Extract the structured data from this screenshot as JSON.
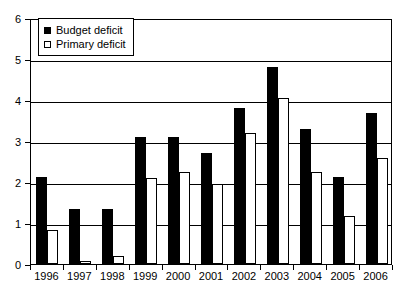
{
  "chart_data": {
    "type": "bar",
    "title": "",
    "subtitle": "",
    "xlabel": "",
    "ylabel": "",
    "ylim": [
      0,
      6
    ],
    "yticks": [
      0,
      1,
      2,
      3,
      4,
      5,
      6
    ],
    "ytick_labels": [
      "0",
      "1",
      "2",
      "3",
      "4",
      "5",
      "6"
    ],
    "grid": true,
    "grid_axis": "y",
    "legend_position": "top-left",
    "categories": [
      "1996",
      "1997",
      "1998",
      "1999",
      "2000",
      "2001",
      "2002",
      "2003",
      "2004",
      "2005",
      "2006"
    ],
    "series": [
      {
        "name": "Budget deficit",
        "color": "#000000",
        "fill": "solid",
        "values": [
          2.12,
          1.33,
          1.33,
          3.1,
          3.1,
          2.7,
          3.8,
          4.8,
          3.3,
          2.13,
          3.68
        ]
      },
      {
        "name": "Primary deficit",
        "color": "#ffffff",
        "fill": "open",
        "values": [
          0.83,
          0.08,
          0.2,
          2.1,
          2.25,
          1.95,
          3.2,
          4.05,
          2.25,
          1.18,
          2.58
        ]
      }
    ]
  },
  "legend": {
    "items": [
      {
        "label": "Budget deficit",
        "swatch": "filled-square-icon"
      },
      {
        "label": "Primary deficit",
        "swatch": "open-square-icon"
      }
    ]
  }
}
